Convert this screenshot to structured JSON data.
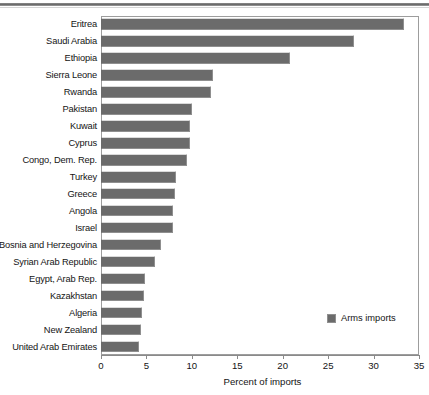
{
  "chart_data": {
    "type": "bar",
    "orientation": "horizontal",
    "title": "",
    "xlabel": "Percent of imports",
    "ylabel": "",
    "xlim": [
      0,
      35
    ],
    "xticks": [
      0,
      5,
      10,
      15,
      20,
      25,
      30,
      35
    ],
    "grid": false,
    "legend_position": "inside-bottom-right",
    "series": [
      {
        "name": "Arms imports",
        "color": "#6b6b6b",
        "values": [
          33.4,
          27.9,
          20.8,
          12.3,
          12.1,
          10.0,
          9.8,
          9.8,
          9.5,
          8.3,
          8.1,
          7.9,
          7.9,
          6.6,
          5.9,
          4.8,
          4.7,
          4.5,
          4.4,
          4.2
        ]
      }
    ],
    "categories": [
      "Eritrea",
      "Saudi Arabia",
      "Ethiopia",
      "Sierra Leone",
      "Rwanda",
      "Pakistan",
      "Kuwait",
      "Cyprus",
      "Congo, Dem. Rep.",
      "Turkey",
      "Greece",
      "Angola",
      "Israel",
      "Bosnia and Herzegovina",
      "Syrian Arab Republic",
      "Egypt, Arab Rep.",
      "Kazakhstan",
      "Algeria",
      "New Zealand",
      "United Arab Emirates"
    ]
  },
  "legend": {
    "entries": [
      {
        "label": "Arms imports",
        "color": "#6b6b6b"
      }
    ]
  },
  "axis": {
    "x_title": "Percent of imports",
    "tick_labels": [
      "0",
      "5",
      "10",
      "15",
      "20",
      "25",
      "30",
      "35"
    ]
  },
  "colors": {
    "bar": "#6b6b6b",
    "frame": "#9d9d9d",
    "text": "#141414"
  }
}
